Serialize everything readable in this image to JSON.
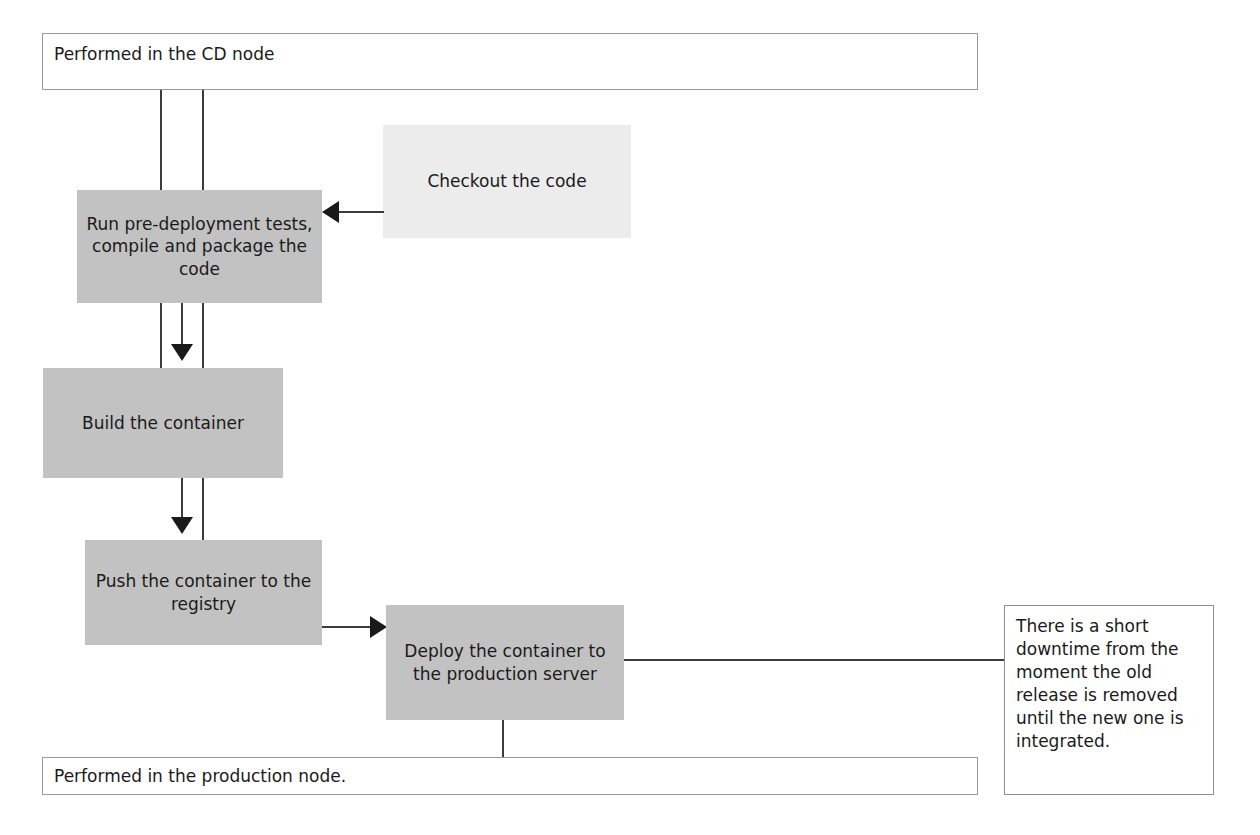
{
  "diagram": {
    "colors": {
      "process_fill": "#c2c2c2",
      "light_process_fill": "#ececec",
      "region_border": "#9a9a9a",
      "connector": "#3b3b3b",
      "text": "#1a1a1a",
      "background": "#ffffff"
    },
    "regions": [
      {
        "id": "cd-node",
        "label": "Performed in the CD node"
      },
      {
        "id": "production-node",
        "label": "Performed in the production node."
      }
    ],
    "nodes": [
      {
        "id": "checkout",
        "label": "Checkout the code",
        "fill": "light"
      },
      {
        "id": "pre-deployment",
        "label": "Run pre-deployment tests, compile and package the code",
        "fill": "gray"
      },
      {
        "id": "build",
        "label": "Build the container",
        "fill": "gray"
      },
      {
        "id": "push",
        "label": "Push the container to the registry",
        "fill": "gray"
      },
      {
        "id": "deploy",
        "label": "Deploy the container to the production server",
        "fill": "gray"
      }
    ],
    "note": {
      "id": "downtime-note",
      "label": "There is a short downtime from the moment the old release is removed until the new one is integrated."
    },
    "edges": [
      {
        "from": "checkout",
        "to": "pre-deployment",
        "style": "arrow-left"
      },
      {
        "from": "pre-deployment",
        "to": "build",
        "style": "arrow-down"
      },
      {
        "from": "build",
        "to": "push",
        "style": "arrow-down"
      },
      {
        "from": "push",
        "to": "deploy",
        "style": "arrow-right"
      },
      {
        "from": "cd-node",
        "to": "build",
        "style": "plain-line"
      },
      {
        "from": "cd-node",
        "to": "push",
        "style": "plain-line"
      },
      {
        "from": "deploy",
        "to": "downtime-note",
        "style": "plain-line"
      },
      {
        "from": "deploy",
        "to": "production-node",
        "style": "plain-line"
      }
    ]
  }
}
